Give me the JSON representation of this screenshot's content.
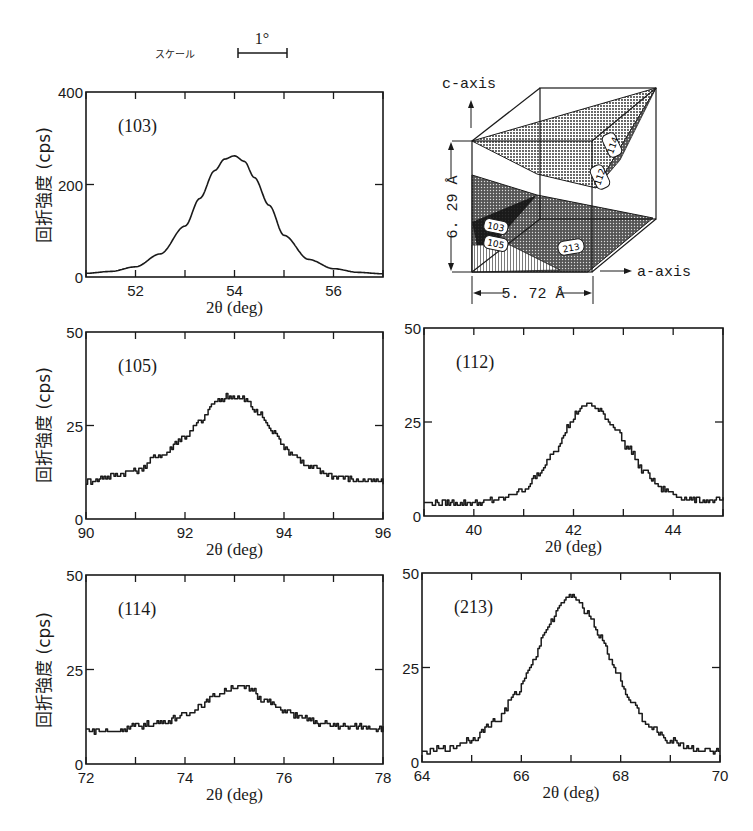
{
  "scale_bar": {
    "label": "スケール",
    "value": "1°"
  },
  "ylabel": "回折強度 (cps)",
  "crystal_diagram": {
    "c_axis_label": "c-axis",
    "a_axis_label": "a-axis",
    "c_length": "6. 29 Å",
    "a_length": "5. 72 Å",
    "plane_labels": [
      "114",
      "112",
      "103",
      "105",
      "213"
    ]
  },
  "chart_data": [
    {
      "type": "line",
      "title": "(103)",
      "xlabel": "2θ (deg)",
      "ylabel": "回折強度 (cps)",
      "xlim": [
        51,
        57
      ],
      "ylim": [
        0,
        400
      ],
      "xticks": [
        52,
        54,
        56
      ],
      "yticks": [
        0,
        200,
        400
      ],
      "grid": false,
      "x": [
        51,
        51.5,
        52,
        52.5,
        53,
        53.3,
        53.6,
        53.8,
        54,
        54.2,
        54.4,
        54.7,
        55,
        55.5,
        56,
        56.5,
        57
      ],
      "y": [
        8,
        12,
        22,
        50,
        110,
        170,
        230,
        255,
        262,
        250,
        215,
        155,
        90,
        38,
        18,
        10,
        7
      ]
    },
    {
      "type": "line",
      "title": "(105)",
      "xlabel": "2θ (deg)",
      "ylabel": "回折強度 (cps)",
      "xlim": [
        90,
        96
      ],
      "ylim": [
        0,
        50
      ],
      "xticks": [
        90,
        92,
        94,
        96
      ],
      "yticks": [
        0,
        25,
        50
      ],
      "grid": false,
      "x": [
        90,
        90.5,
        91,
        91.5,
        92,
        92.3,
        92.6,
        92.9,
        93.2,
        93.5,
        93.8,
        94.1,
        94.5,
        95,
        95.5,
        96
      ],
      "y": [
        10,
        11.5,
        13,
        17,
        22,
        26,
        31,
        33,
        32,
        28,
        23,
        18,
        14,
        11.5,
        10.5,
        10
      ]
    },
    {
      "type": "line",
      "title": "(112)",
      "xlabel": "2θ (deg)",
      "ylabel": "",
      "xlim": [
        39,
        45
      ],
      "ylim": [
        0,
        50
      ],
      "xticks": [
        40,
        42,
        44
      ],
      "yticks": [
        0,
        25,
        50
      ],
      "grid": false,
      "x": [
        39,
        39.5,
        40,
        40.5,
        41,
        41.3,
        41.6,
        41.9,
        42.1,
        42.3,
        42.5,
        42.8,
        43.1,
        43.4,
        43.8,
        44.2,
        44.6,
        45
      ],
      "y": [
        3.5,
        3.5,
        3.5,
        4.5,
        7,
        11,
        17,
        24,
        28,
        30,
        28,
        24,
        18,
        12,
        7,
        5,
        4,
        4
      ]
    },
    {
      "type": "line",
      "title": "(114)",
      "xlabel": "2θ (deg)",
      "ylabel": "回折強度 (cps)",
      "xlim": [
        72,
        78
      ],
      "ylim": [
        0,
        50
      ],
      "xticks": [
        72,
        74,
        76,
        78
      ],
      "yticks": [
        0,
        25,
        50
      ],
      "grid": false,
      "x": [
        72,
        72.5,
        73,
        73.5,
        74,
        74.3,
        74.6,
        75,
        75.3,
        75.6,
        76,
        76.4,
        76.8,
        77.3,
        78
      ],
      "y": [
        9,
        8.5,
        10,
        11,
        13,
        15.5,
        18,
        20.5,
        20,
        17,
        14,
        12,
        10.5,
        10,
        9.5
      ]
    },
    {
      "type": "line",
      "title": "(213)",
      "xlabel": "2θ (deg)",
      "ylabel": "",
      "xlim": [
        64,
        70
      ],
      "ylim": [
        0,
        50
      ],
      "xticks": [
        64,
        66,
        68,
        70
      ],
      "yticks": [
        0,
        25,
        50
      ],
      "grid": false,
      "x": [
        64,
        64.5,
        65,
        65.5,
        65.9,
        66.2,
        66.5,
        66.8,
        67,
        67.3,
        67.6,
        67.9,
        68.2,
        68.6,
        69,
        69.5,
        70
      ],
      "y": [
        2.5,
        3.5,
        6,
        11,
        18,
        26,
        35,
        42,
        44,
        40,
        33,
        24,
        16,
        9,
        5.5,
        3.5,
        2.5
      ]
    }
  ]
}
